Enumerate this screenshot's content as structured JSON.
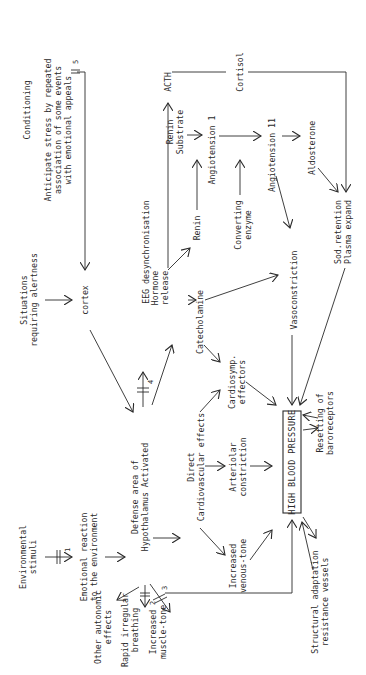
{
  "diagram": {
    "orientation": "rotated-90-ccw",
    "colors": {
      "ink": "#2a2a2a",
      "background": "#ffffff"
    },
    "nodes": {
      "conditioning": "Conditioning",
      "anticipate": "Anticipate stress by repeated\nassociation of some events\nwith emotional appeals",
      "situations": "Situations\nrequiring alertness",
      "cortex": "cortex",
      "environmental": "Environmental\nstimuli",
      "emotional": "Emotional reaction\nto the environment",
      "defense": "Defense area of\nHypothalamus Activated",
      "eeg": "EEG desynchronisation",
      "hormone": "Hormone\nrelease",
      "acth": "ACTH",
      "renin_substrate": "Renin\nSubstrate",
      "renin": "Renin",
      "catecholamine": "Catecholamine",
      "angiotension1": "Angiotension 1",
      "converting": "Converting\nenzyme",
      "cortisol": "Cortisol",
      "angiotension2": "Angiotension 11",
      "aldosterone": "Aldosterone",
      "vasoconstriction": "Vasoconstriction",
      "sodium": "Sod.retention\nPlasma expand",
      "cardiosymp": "Cardiosymp.\neffectors",
      "direct": "Direct\nCardiovascular effects",
      "arteriolar": "Arteriolar\nconstriction",
      "hbp": "HIGH BLOOD PRESSURE",
      "resetting": "Resetting of\nbaroreceptors",
      "venous": "Increased\nvenous-tone",
      "structural": "Structural adaptation\nresistance vessels",
      "other_autonomic": "Other autonomic\neffects",
      "rapid_breathing": "Rapid irregular\nbreathing",
      "muscle_tone": "Increased\nmuscle-tone"
    },
    "block_markers": [
      "1",
      "2",
      "3",
      "4",
      "5"
    ]
  }
}
